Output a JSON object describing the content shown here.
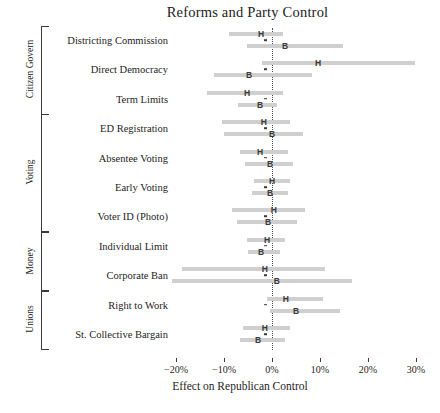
{
  "chart_data": {
    "type": "dot-with-error-bars",
    "title": "Reforms and Party Control",
    "xlabel": "Effect on Republican Control",
    "ylabel": "",
    "xlim": [
      -22,
      32
    ],
    "xticks": [
      -20,
      -10,
      0,
      10,
      20,
      30
    ],
    "xticklabels": [
      "−20%",
      "−10%",
      "0%",
      "10%",
      "20%",
      "30%"
    ],
    "grid": false,
    "legend_position": "none",
    "zero_reference_line": 0,
    "series": [
      {
        "name": "H",
        "marker_label": "H",
        "description": "House"
      },
      {
        "name": "B",
        "marker_label": "B",
        "description": "Both chambers"
      }
    ],
    "groups": [
      {
        "label": "Citizen Govern",
        "categories": [
          {
            "label": "Districting Commission",
            "points": [
              {
                "series": "H",
                "estimate": -2.3,
                "ci_low": -9.0,
                "ci_high": 2.3
              },
              {
                "series": "B",
                "estimate": 2.7,
                "ci_low": -5.2,
                "ci_high": 14.8
              }
            ]
          },
          {
            "label": "Direct Democracy",
            "points": [
              {
                "series": "H",
                "estimate": 9.6,
                "ci_low": -2.1,
                "ci_high": 29.8
              },
              {
                "series": "B",
                "estimate": -4.8,
                "ci_low": -12.1,
                "ci_high": 8.3
              }
            ]
          },
          {
            "label": "Term Limits",
            "points": [
              {
                "series": "H",
                "estimate": -5.2,
                "ci_low": -13.5,
                "ci_high": 2.3
              },
              {
                "series": "B",
                "estimate": -2.5,
                "ci_low": -7.1,
                "ci_high": 1.0
              }
            ]
          }
        ]
      },
      {
        "label": "Voting",
        "categories": [
          {
            "label": "ED Registration",
            "points": [
              {
                "series": "H",
                "estimate": -1.7,
                "ci_low": -10.4,
                "ci_high": 3.8
              },
              {
                "series": "B",
                "estimate": 0.0,
                "ci_low": -10.0,
                "ci_high": 6.5
              }
            ]
          },
          {
            "label": "Absentee Voting",
            "points": [
              {
                "series": "H",
                "estimate": -2.5,
                "ci_low": -6.7,
                "ci_high": 3.3
              },
              {
                "series": "B",
                "estimate": -0.4,
                "ci_low": -5.6,
                "ci_high": 4.4
              }
            ]
          },
          {
            "label": "Early Voting",
            "points": [
              {
                "series": "H",
                "estimate": 0.0,
                "ci_low": -3.8,
                "ci_high": 3.8
              },
              {
                "series": "B",
                "estimate": -0.4,
                "ci_low": -4.2,
                "ci_high": 3.3
              }
            ]
          },
          {
            "label": "Voter ID (Photo)",
            "points": [
              {
                "series": "H",
                "estimate": 0.4,
                "ci_low": -8.3,
                "ci_high": 6.9
              },
              {
                "series": "B",
                "estimate": -0.8,
                "ci_low": -7.3,
                "ci_high": 5.2
              }
            ]
          }
        ]
      },
      {
        "label": "Money",
        "categories": [
          {
            "label": "Individual Limit",
            "points": [
              {
                "series": "H",
                "estimate": -1.0,
                "ci_low": -5.2,
                "ci_high": 2.7
              },
              {
                "series": "B",
                "estimate": -2.3,
                "ci_low": -5.0,
                "ci_high": 1.7
              }
            ]
          },
          {
            "label": "Corporate Ban",
            "points": [
              {
                "series": "H",
                "estimate": -1.5,
                "ci_low": -18.8,
                "ci_high": 11.0
              },
              {
                "series": "B",
                "estimate": 1.0,
                "ci_low": -20.8,
                "ci_high": 16.7
              }
            ]
          }
        ]
      },
      {
        "label": "Unions",
        "categories": [
          {
            "label": "Right to Work",
            "points": [
              {
                "series": "H",
                "estimate": 2.9,
                "ci_low": -1.0,
                "ci_high": 10.6
              },
              {
                "series": "B",
                "estimate": 5.0,
                "ci_low": -0.4,
                "ci_high": 14.2
              }
            ]
          },
          {
            "label": "St. Collective Bargain",
            "points": [
              {
                "series": "H",
                "estimate": -1.5,
                "ci_low": -6.0,
                "ci_high": 3.8
              },
              {
                "series": "B",
                "estimate": -2.9,
                "ci_low": -6.7,
                "ci_high": 2.7
              }
            ]
          }
        ]
      }
    ]
  },
  "colors": {
    "bar": "#cfcfcf",
    "marker": "#3a3a3a",
    "axis": "#3a3a3a",
    "text": "#1d1d1d",
    "background": "#ffffff"
  }
}
